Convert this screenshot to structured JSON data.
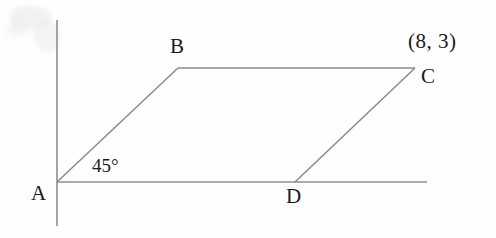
{
  "figure": {
    "type": "geometry-diagram",
    "background_color": "#fefefe",
    "line_color": "#8a8a8a",
    "axis_color": "#8f8f8f",
    "text_color": "#1a1a1a",
    "axes": {
      "y_axis": {
        "name": "y-axis",
        "x": 57,
        "y_top": 20,
        "y_bottom": 226
      },
      "x_axis": {
        "name": "x-axis",
        "y": 182,
        "x_left": 57,
        "x_right": 427
      }
    },
    "vertices": [
      {
        "id": "A",
        "label": "A",
        "x": 57,
        "y": 182
      },
      {
        "id": "B",
        "label": "B",
        "x": 178,
        "y": 68
      },
      {
        "id": "C",
        "label": "C",
        "x": 415,
        "y": 68
      },
      {
        "id": "D",
        "label": "D",
        "x": 295,
        "y": 182
      }
    ],
    "edges": [
      {
        "from": "A",
        "to": "B"
      },
      {
        "from": "B",
        "to": "C"
      },
      {
        "from": "D",
        "to": "C"
      },
      {
        "from": "A",
        "to": "D"
      }
    ],
    "labels": {
      "vertex_a": "A",
      "vertex_b": "B",
      "vertex_c": "C",
      "vertex_d": "D",
      "angle_at_a": "45°",
      "point_c_coordinates": "(8, 3)"
    }
  }
}
